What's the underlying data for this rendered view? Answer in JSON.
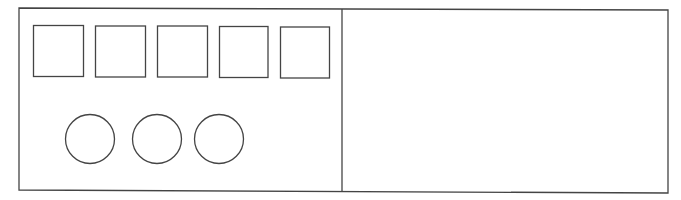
{
  "diagram": {
    "stroke_color": "#444444",
    "background_color": "#ffffff",
    "panels": [
      {
        "id": "left-panel",
        "squares": 5,
        "circles": 3
      },
      {
        "id": "right-panel",
        "squares": 0,
        "circles": 0
      }
    ]
  }
}
